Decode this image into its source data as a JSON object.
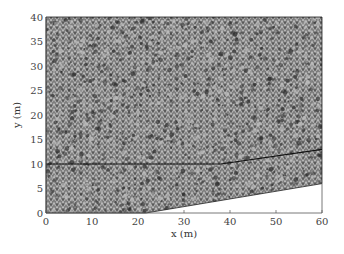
{
  "chart_data": {
    "type": "mesh",
    "title": "",
    "xlabel": "x (m)",
    "ylabel": "y (m)",
    "xlim": [
      0,
      60
    ],
    "ylim": [
      0,
      40
    ],
    "xticks": [
      0,
      10,
      20,
      30,
      40,
      50,
      60
    ],
    "yticks": [
      0,
      5,
      10,
      15,
      20,
      25,
      30,
      35,
      40
    ],
    "grid": false,
    "legend": null,
    "domain_boundary": [
      [
        0,
        0
      ],
      [
        21.7,
        0
      ],
      [
        60,
        6
      ],
      [
        60,
        40
      ],
      [
        0,
        40
      ]
    ],
    "interface_line": [
      [
        0,
        10
      ],
      [
        38,
        10
      ],
      [
        60,
        13
      ]
    ]
  },
  "colors": {
    "mesh_dark": "#3a3a3a",
    "mesh_light": "#b8b8b8",
    "line": "#111111",
    "axis": "#555555"
  }
}
